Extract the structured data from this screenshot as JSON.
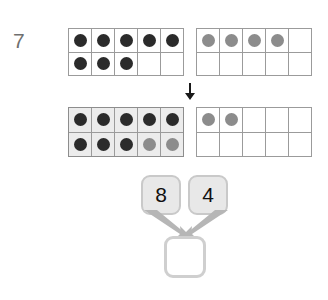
{
  "worksheet": {
    "question_number": "7",
    "colors": {
      "dark_counter": "#2b2b2b",
      "light_counter": "#8c8c8c",
      "frame_border": "#9b9b9b",
      "frame_highlight_fill": "#ececec",
      "box_fill": "#e8e8e8",
      "box_border": "#c9c9c9",
      "arrow": "#aaaaaa",
      "transition_arrow": "#1a1a1a",
      "number_text": "#6f6f6f",
      "page_background": "#ffffff"
    }
  },
  "ten_frames": {
    "top_left": {
      "label": "first-ten-frame-before",
      "highlighted": false,
      "filled_count": 8,
      "rows": [
        [
          "dark",
          "dark",
          "dark",
          "dark",
          "dark"
        ],
        [
          "dark",
          "dark",
          "dark",
          "none",
          "none"
        ]
      ]
    },
    "top_right": {
      "label": "second-ten-frame-before",
      "highlighted": false,
      "filled_count": 4,
      "rows": [
        [
          "light",
          "light",
          "light",
          "light",
          "none"
        ],
        [
          "none",
          "none",
          "none",
          "none",
          "none"
        ]
      ]
    },
    "bottom_left": {
      "label": "first-ten-frame-after",
      "highlighted": true,
      "filled_count": 10,
      "rows": [
        [
          "dark",
          "dark",
          "dark",
          "dark",
          "dark"
        ],
        [
          "dark",
          "dark",
          "dark",
          "light",
          "light"
        ]
      ]
    },
    "bottom_right": {
      "label": "second-ten-frame-after",
      "highlighted": false,
      "filled_count": 2,
      "rows": [
        [
          "light",
          "light",
          "none",
          "none",
          "none"
        ],
        [
          "none",
          "none",
          "none",
          "none",
          "none"
        ]
      ]
    }
  },
  "transition": {
    "icon": "arrow-down-icon"
  },
  "number_bond": {
    "addend_1": "8",
    "addend_2": "4",
    "sum": "",
    "sum_placeholder": "",
    "arrow_icons": [
      "arrow-down-right-icon",
      "arrow-down-left-icon"
    ]
  }
}
